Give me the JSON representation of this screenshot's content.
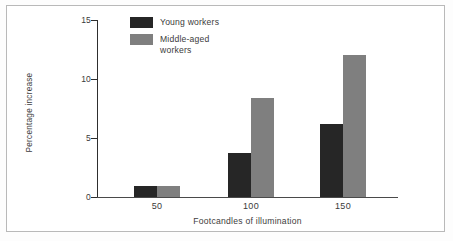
{
  "chart_data": {
    "type": "bar",
    "title": "",
    "subtitle": "",
    "xlabel": "Footcandles of illumination",
    "ylabel": "Percentage increase",
    "categories": [
      "50",
      "100",
      "150"
    ],
    "series": [
      {
        "name": "Young workers",
        "color": "#262626",
        "values": [
          0.9,
          3.7,
          6.2
        ]
      },
      {
        "name": "Middle-aged\nworkers",
        "legend_text": "Middle-aged workers",
        "color": "#7f7f7f",
        "values": [
          0.9,
          8.4,
          12.0
        ]
      }
    ],
    "ylim": [
      0,
      15
    ],
    "yticks": [
      0,
      5,
      10,
      15
    ],
    "ytick_labels": [
      "0",
      "5",
      "10",
      "15"
    ],
    "grid": false,
    "legend_position": "top-left-inside",
    "frame": true
  },
  "legend": {
    "entries": [
      {
        "label": "Young workers"
      },
      {
        "label": "Middle-aged\nworkers"
      }
    ]
  },
  "axes": {
    "y_title": "Percentage increase",
    "x_title": "Footcandles of illumination",
    "y_labels": [
      "15",
      "10",
      "5",
      "0"
    ],
    "x_labels": [
      "50",
      "100",
      "150"
    ]
  }
}
